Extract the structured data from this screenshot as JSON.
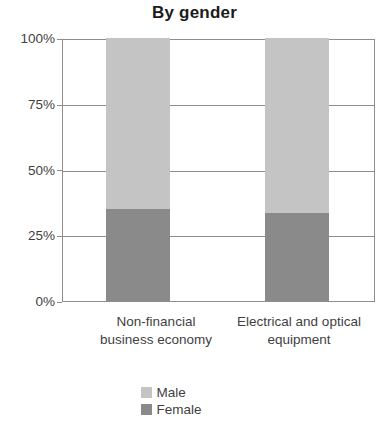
{
  "chart_data": {
    "type": "bar",
    "subtype": "stacked-percentage-column",
    "title": "By gender",
    "xlabel": "",
    "ylabel": "",
    "ylim": [
      0,
      100
    ],
    "yunit": "%",
    "ytick_labels": [
      "100%",
      "75%",
      "50%",
      "25%",
      "0%"
    ],
    "ytick_values": [
      100,
      75,
      50,
      25,
      0
    ],
    "grid": true,
    "legend_position": "bottom",
    "categories": [
      "Non-financial business economy",
      "Electrical and optical equipment"
    ],
    "category_lines": [
      [
        "Non-financial",
        "business economy"
      ],
      [
        "Electrical and optical",
        "equipment"
      ]
    ],
    "series": [
      {
        "name": "Male",
        "color": "#c4c4c4",
        "values": [
          65.0,
          66.5
        ]
      },
      {
        "name": "Female",
        "color": "#8a8a8a",
        "values": [
          35.0,
          33.5
        ]
      }
    ],
    "stack_order_bottom_to_top": [
      "Female",
      "Male"
    ],
    "colors": {
      "male": "#c4c4c4",
      "female": "#8a8a8a",
      "axis": "#8d8d8d",
      "text": "#3f3f3f",
      "title": "#1b1b1b",
      "background": "#ffffff"
    }
  },
  "legend": {
    "items": [
      {
        "label": "Male"
      },
      {
        "label": "Female"
      }
    ]
  }
}
